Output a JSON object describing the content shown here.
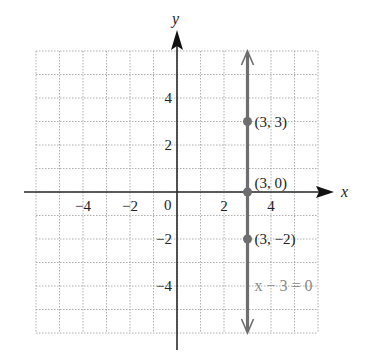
{
  "chart_data": {
    "type": "line",
    "title": "",
    "xlabel": "x",
    "ylabel": "y",
    "xlim": [
      -6,
      6
    ],
    "ylim": [
      -6,
      6
    ],
    "grid": true,
    "grid_style": "dotted",
    "x_ticks": [
      {
        "value": -4,
        "label": "−4"
      },
      {
        "value": -2,
        "label": "−2"
      },
      {
        "value": 2,
        "label": "2"
      },
      {
        "value": 4,
        "label": "4"
      }
    ],
    "y_ticks": [
      {
        "value": 4,
        "label": "4"
      },
      {
        "value": 2,
        "label": "2"
      },
      {
        "value": -2,
        "label": "−2"
      },
      {
        "value": -4,
        "label": "−4"
      }
    ],
    "origin_label": "0",
    "series": [
      {
        "name": "x − 3 = 0",
        "kind": "vertical-line",
        "x": 3,
        "y_range": [
          -6,
          6
        ],
        "arrows": "both",
        "color": "#6e6e6e"
      }
    ],
    "points": [
      {
        "x": 3,
        "y": 3,
        "label": "(3, 3)"
      },
      {
        "x": 3,
        "y": 0,
        "label": "(3, 0)"
      },
      {
        "x": 3,
        "y": -2,
        "label": "(3, −2)"
      }
    ],
    "annotations": [
      {
        "text": "x − 3 = 0",
        "x": 3.3,
        "y": -4
      }
    ]
  },
  "colors": {
    "axis": "#2a2a2a",
    "grid": "#9a9a9a",
    "line": "#6e6e6e",
    "point": "#6e6e6e",
    "equation": "#8a8a8a"
  }
}
